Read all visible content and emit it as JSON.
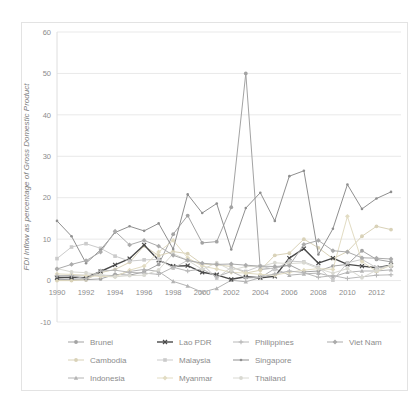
{
  "chart_data": {
    "type": "line",
    "title": "",
    "xlabel": "",
    "ylabel": "FDI Inflow as percentage of Gross Domestic Product",
    "ylim": [
      -10,
      60
    ],
    "y_ticks": [
      -10,
      0,
      10,
      20,
      30,
      40,
      50,
      60
    ],
    "x_ticks": [
      1990,
      1992,
      1994,
      1996,
      1998,
      2000,
      2002,
      2004,
      2006,
      2008,
      2010,
      2012
    ],
    "x": [
      1990,
      1991,
      1992,
      1993,
      1994,
      1995,
      1996,
      1997,
      1998,
      1999,
      2000,
      2001,
      2002,
      2003,
      2004,
      2005,
      2006,
      2007,
      2008,
      2009,
      2010,
      2011,
      2012,
      2013
    ],
    "grid": true,
    "legend_position": "bottom",
    "axis_text_color": "#8c8c8c",
    "grid_color": "#e9e9e9",
    "border_color": "#e3e3e3",
    "series": [
      {
        "name": "Brunei",
        "color": "#a3a3a3",
        "marker": "circle",
        "width": 1,
        "values": [
          0.3,
          0.2,
          0.2,
          0.4,
          1.5,
          1.3,
          2.1,
          3.9,
          11.2,
          15.7,
          9.1,
          9.4,
          17.7,
          50.0,
          2.7,
          3.0,
          3.8,
          2.1,
          2.3,
          3.5,
          3.9,
          7.2,
          5.1,
          4.5
        ]
      },
      {
        "name": "Cambodia",
        "color": "#d9d2b8",
        "marker": "circle",
        "width": 1,
        "values": [
          0.0,
          0.0,
          0.2,
          1.9,
          2.7,
          4.4,
          8.4,
          6.0,
          7.0,
          6.5,
          4.0,
          3.8,
          3.4,
          1.8,
          2.5,
          6.1,
          6.6,
          10.0,
          7.9,
          5.3,
          7.0,
          10.7,
          13.1,
          12.3
        ]
      },
      {
        "name": "Indonesia",
        "color": "#b4b4b4",
        "marker": "triangle",
        "width": 1,
        "values": [
          1.0,
          1.3,
          1.3,
          1.3,
          1.2,
          2.2,
          2.7,
          2.2,
          -0.2,
          -1.3,
          -2.8,
          -1.9,
          0.1,
          -0.3,
          0.7,
          2.9,
          1.3,
          1.6,
          1.8,
          0.9,
          2.0,
          2.3,
          2.3,
          2.6
        ]
      },
      {
        "name": "Lao PDR",
        "color": "#4a4a4a",
        "marker": "x",
        "width": 1.4,
        "values": [
          0.7,
          0.8,
          0.7,
          2.2,
          3.8,
          5.3,
          8.6,
          4.9,
          3.5,
          3.6,
          2.0,
          1.4,
          0.3,
          0.9,
          0.7,
          1.0,
          5.4,
          7.7,
          4.2,
          5.4,
          3.9,
          3.5,
          3.1,
          3.7
        ]
      },
      {
        "name": "Malaysia",
        "color": "#cbcbcb",
        "marker": "square",
        "width": 1,
        "values": [
          5.3,
          8.1,
          8.9,
          7.8,
          5.9,
          4.7,
          5.0,
          5.1,
          3.0,
          4.9,
          4.0,
          0.6,
          3.2,
          2.2,
          3.5,
          2.7,
          4.7,
          4.5,
          3.2,
          0.1,
          4.3,
          5.1,
          3.1,
          3.5
        ]
      },
      {
        "name": "Myanmar",
        "color": "#e2dcc3",
        "marker": "diamond",
        "width": 1,
        "values": [
          1.6,
          1.5,
          1.2,
          1.0,
          0.9,
          2.5,
          3.5,
          6.9,
          9.7,
          5.5,
          3.5,
          2.8,
          2.0,
          1.8,
          1.5,
          1.3,
          2.0,
          2.5,
          2.9,
          2.7,
          15.5,
          4.6,
          2.2,
          3.7
        ]
      },
      {
        "name": "Philippines",
        "color": "#b8b8b8",
        "marker": "plus",
        "width": 1,
        "values": [
          1.2,
          1.2,
          0.4,
          2.3,
          2.5,
          2.0,
          1.8,
          1.5,
          3.2,
          2.3,
          2.8,
          0.9,
          2.2,
          0.6,
          0.8,
          1.6,
          2.3,
          1.9,
          0.8,
          1.2,
          0.5,
          0.9,
          1.3,
          1.4
        ]
      },
      {
        "name": "Singapore",
        "color": "#8f8f8f",
        "marker": "dot",
        "width": 1,
        "values": [
          14.4,
          10.7,
          4.2,
          7.4,
          11.6,
          13.1,
          12.0,
          13.8,
          7.6,
          20.8,
          16.3,
          18.6,
          7.5,
          17.5,
          21.2,
          14.4,
          25.2,
          26.5,
          6.3,
          12.5,
          23.2,
          17.3,
          19.8,
          21.4
        ]
      },
      {
        "name": "Thailand",
        "color": "#d9d9d2",
        "marker": "circle",
        "width": 1,
        "values": [
          2.9,
          2.1,
          1.9,
          1.4,
          0.9,
          1.2,
          1.3,
          2.6,
          6.5,
          4.9,
          2.7,
          4.3,
          2.5,
          3.4,
          3.4,
          4.3,
          4.1,
          4.3,
          2.9,
          1.8,
          2.9,
          0.7,
          2.5,
          3.8
        ]
      },
      {
        "name": "Viet Nam",
        "color": "#ababab",
        "marker": "diamond",
        "width": 1,
        "values": [
          2.8,
          3.9,
          4.8,
          6.9,
          11.9,
          8.6,
          9.7,
          8.3,
          6.1,
          4.9,
          4.2,
          3.9,
          4.0,
          3.7,
          3.5,
          3.4,
          3.6,
          8.7,
          9.7,
          7.2,
          6.9,
          5.5,
          5.4,
          5.2
        ]
      }
    ]
  }
}
